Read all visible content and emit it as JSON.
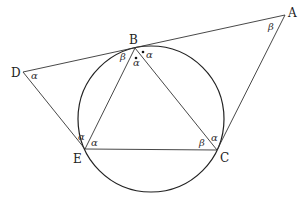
{
  "diagram": {
    "points": {
      "A": {
        "label": "A",
        "x": 285,
        "y": 15
      },
      "B": {
        "label": "B",
        "x": 135,
        "y": 48
      },
      "C": {
        "label": "C",
        "x": 217,
        "y": 150
      },
      "D": {
        "label": "D",
        "x": 23,
        "y": 72
      },
      "E": {
        "label": "E",
        "x": 85,
        "y": 149
      }
    },
    "circle": {
      "cx": 151,
      "cy": 119,
      "r": 73
    },
    "angles": {
      "D": "α",
      "A": "β",
      "B_left": "β",
      "B_right": "α",
      "B_bottom": "α",
      "E_left": "α",
      "E_right": "α",
      "C_left": "β",
      "C_top": "α"
    }
  }
}
